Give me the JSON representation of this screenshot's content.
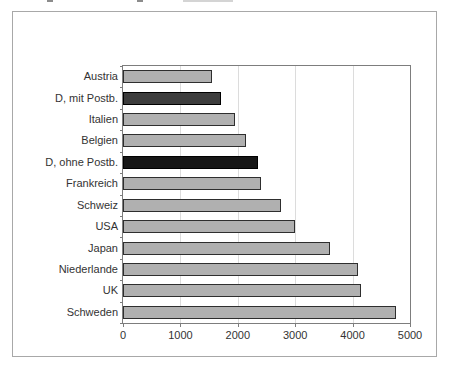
{
  "chart_data": {
    "type": "bar",
    "orientation": "horizontal",
    "title": "",
    "xlabel": "",
    "ylabel": "",
    "categories": [
      "Austria",
      "D, mit Postb.",
      "Italien",
      "Belgien",
      "D, ohne Postb.",
      "Frankreich",
      "Schweiz",
      "USA",
      "Japan",
      "Niederlande",
      "UK",
      "Schweden"
    ],
    "values": [
      1550,
      1700,
      1950,
      2150,
      2350,
      2400,
      2750,
      3000,
      3600,
      4100,
      4150,
      4750
    ],
    "bar_colors": [
      "#b0b0b0",
      "#3d3d3d",
      "#b0b0b0",
      "#b0b0b0",
      "#161616",
      "#b0b0b0",
      "#b0b0b0",
      "#b0b0b0",
      "#b0b0b0",
      "#b0b0b0",
      "#b0b0b0",
      "#b0b0b0"
    ],
    "bar_border_colors": [
      "#2e2e2e",
      "#000000",
      "#2e2e2e",
      "#2e2e2e",
      "#000000",
      "#2e2e2e",
      "#2e2e2e",
      "#2e2e2e",
      "#2e2e2e",
      "#2e2e2e",
      "#2e2e2e",
      "#2e2e2e"
    ],
    "xlim": [
      0,
      5000
    ],
    "x_ticks": [
      "0",
      "1000",
      "2000",
      "3000",
      "4000",
      "5000"
    ],
    "grid": true,
    "legend": false,
    "colors": {
      "bar_default": "#b0b0b0",
      "bar_dark_gray": "#3d3d3d",
      "bar_black": "#161616",
      "gridline": "#dcdcdc",
      "plot_border": "#7d7d7d",
      "figure_border": "#a8a8a8",
      "text": "#333333",
      "background": "#ffffff"
    }
  }
}
